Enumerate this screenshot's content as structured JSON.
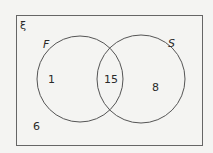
{
  "diagram": {
    "type": "venn",
    "universal_symbol": "ξ",
    "sets": [
      {
        "name": "F",
        "only_count": "1"
      },
      {
        "name": "S",
        "only_count": "8"
      }
    ],
    "intersection_count": "15",
    "outside_count": "6"
  },
  "colors": {
    "background": "#f4f4f2",
    "line": "#555555",
    "text": "#2a2a2a"
  }
}
